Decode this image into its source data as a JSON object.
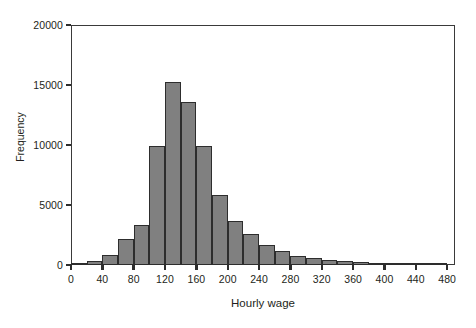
{
  "chart_data": {
    "type": "bar",
    "subtype": "histogram",
    "title": "",
    "subtitle": "",
    "xlabel": "Hourly wage",
    "ylabel": "Frequency",
    "xlim": [
      0,
      490
    ],
    "ylim": [
      0,
      20000
    ],
    "grid": false,
    "legend": null,
    "bin_width": 20,
    "x_ticks": [
      0,
      40,
      80,
      120,
      160,
      200,
      240,
      280,
      320,
      360,
      400,
      440,
      480
    ],
    "x_tick_labels": [
      "0",
      "40",
      "80",
      "120",
      "160",
      "200",
      "240",
      "280",
      "320",
      "360",
      "400",
      "440",
      "480"
    ],
    "y_ticks": [
      0,
      5000,
      10000,
      15000,
      20000
    ],
    "y_tick_labels": [
      "0",
      "5000",
      "10000",
      "15000",
      "20000"
    ],
    "bar_color": "#808080",
    "bar_edge_color": "#2d2d2d",
    "axis_color": "#3a3a3a",
    "background_color": "#ffffff",
    "bins": [
      {
        "x0": 0,
        "x1": 20,
        "value": 60
      },
      {
        "x0": 20,
        "x1": 40,
        "value": 370
      },
      {
        "x0": 40,
        "x1": 60,
        "value": 830
      },
      {
        "x0": 60,
        "x1": 80,
        "value": 2130
      },
      {
        "x0": 80,
        "x1": 100,
        "value": 3330
      },
      {
        "x0": 100,
        "x1": 120,
        "value": 9950
      },
      {
        "x0": 120,
        "x1": 140,
        "value": 15230
      },
      {
        "x0": 140,
        "x1": 160,
        "value": 13550
      },
      {
        "x0": 160,
        "x1": 180,
        "value": 9950
      },
      {
        "x0": 180,
        "x1": 200,
        "value": 5800
      },
      {
        "x0": 200,
        "x1": 220,
        "value": 3700
      },
      {
        "x0": 220,
        "x1": 240,
        "value": 2550
      },
      {
        "x0": 240,
        "x1": 260,
        "value": 1700
      },
      {
        "x0": 260,
        "x1": 280,
        "value": 1150
      },
      {
        "x0": 280,
        "x1": 300,
        "value": 780
      },
      {
        "x0": 300,
        "x1": 320,
        "value": 600
      },
      {
        "x0": 320,
        "x1": 340,
        "value": 450
      },
      {
        "x0": 340,
        "x1": 360,
        "value": 330
      },
      {
        "x0": 360,
        "x1": 380,
        "value": 250
      },
      {
        "x0": 380,
        "x1": 400,
        "value": 200
      },
      {
        "x0": 400,
        "x1": 420,
        "value": 150
      },
      {
        "x0": 420,
        "x1": 440,
        "value": 110
      },
      {
        "x0": 440,
        "x1": 460,
        "value": 80
      },
      {
        "x0": 460,
        "x1": 480,
        "value": 60
      }
    ]
  }
}
